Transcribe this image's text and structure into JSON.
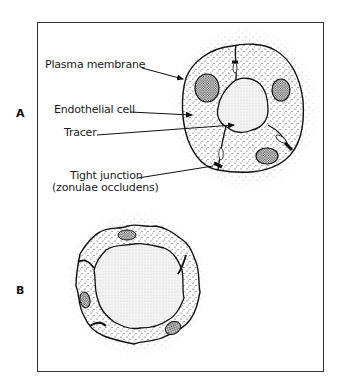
{
  "figure": {
    "panels": [
      {
        "id": "A",
        "label": "A",
        "callouts": [
          {
            "text": "Plasma membrane"
          },
          {
            "text": "Endothelial cell"
          },
          {
            "text": "Tracer"
          },
          {
            "text": "Tight junction"
          },
          {
            "text": "(zonulae occludens)"
          }
        ]
      },
      {
        "id": "B",
        "label": "B",
        "callouts": []
      }
    ]
  }
}
